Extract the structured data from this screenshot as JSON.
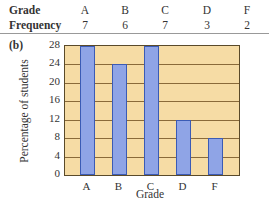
{
  "table": {
    "row1_header": "Grade",
    "row2_header": "Frequency",
    "grades": [
      "A",
      "B",
      "C",
      "D",
      "F"
    ],
    "frequencies": [
      "7",
      "6",
      "7",
      "3",
      "2"
    ]
  },
  "part_label": "(b)",
  "chart_data": {
    "type": "bar",
    "title": "",
    "categories": [
      "A",
      "B",
      "C",
      "D",
      "F"
    ],
    "values": [
      28,
      24,
      28,
      12,
      8
    ],
    "xlabel": "Grade",
    "ylabel": "Percentage of students",
    "ylim": [
      0,
      28
    ],
    "yticks": [
      "0",
      "4",
      "8",
      "12",
      "16",
      "20",
      "24",
      "28"
    ],
    "grid": true,
    "bar_color": "#8fa4e6",
    "background_color": "#f6dca5"
  }
}
